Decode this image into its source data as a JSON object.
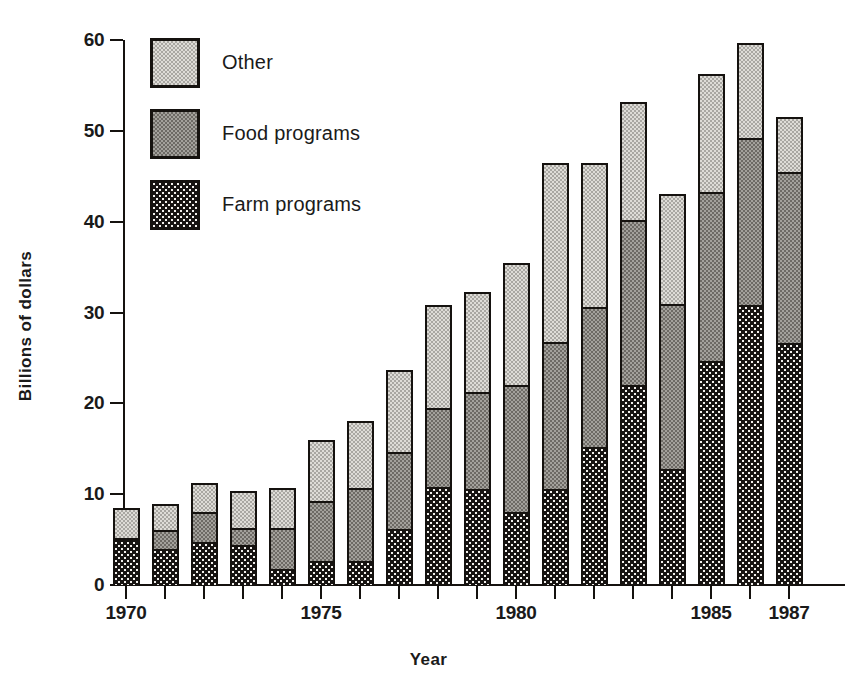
{
  "chart_data": {
    "type": "bar",
    "subtype": "stacked",
    "title": "",
    "xlabel": "Year",
    "ylabel": "Billions of dollars",
    "categories": [
      "1970",
      "1971",
      "1972",
      "1973",
      "1974",
      "1975",
      "1976",
      "1977",
      "1978",
      "1979",
      "1980",
      "1981",
      "1982",
      "1983",
      "1984",
      "1985",
      "1986",
      "1987"
    ],
    "visible_tick_labels": [
      "1970",
      "1975",
      "1980",
      "1985",
      "1987"
    ],
    "ylim": [
      0,
      60
    ],
    "yticks": [
      0,
      10,
      20,
      30,
      40,
      50,
      60
    ],
    "ytick_labels": [
      "0",
      "10",
      "20",
      "30",
      "40",
      "50",
      "60"
    ],
    "grid": false,
    "legend_position": "upper-left-inside",
    "series": [
      {
        "name": "Farm programs",
        "color": "#171412",
        "texture": "dark-dotted",
        "values": [
          5.0,
          4.0,
          4.7,
          4.4,
          1.8,
          2.6,
          2.6,
          6.2,
          10.8,
          10.6,
          8.0,
          10.6,
          15.2,
          22.0,
          12.8,
          24.7,
          30.8,
          26.6
        ]
      },
      {
        "name": "Food programs",
        "color": "#a3a19c",
        "texture": "mid-checker",
        "values": [
          0.2,
          2.1,
          3.3,
          1.9,
          4.5,
          6.6,
          8.1,
          8.4,
          8.7,
          10.7,
          14.0,
          16.1,
          15.4,
          18.2,
          18.1,
          18.6,
          18.4,
          18.9
        ]
      },
      {
        "name": "Other",
        "color": "#dedcd7",
        "texture": "light-checker",
        "values": [
          3.3,
          2.8,
          3.2,
          4.0,
          4.4,
          6.8,
          7.4,
          9.1,
          11.3,
          11.0,
          13.4,
          19.8,
          15.9,
          13.0,
          12.1,
          13.0,
          10.5,
          6.0
        ]
      }
    ],
    "totals": [
      8.5,
      8.9,
      11.2,
      10.3,
      10.7,
      16.0,
      18.1,
      23.7,
      30.8,
      32.3,
      35.4,
      46.5,
      46.5,
      53.2,
      43.0,
      56.3,
      59.7,
      51.5
    ]
  },
  "legend": {
    "items": [
      {
        "label": "Other",
        "series": "Other"
      },
      {
        "label": "Food programs",
        "series": "Food programs"
      },
      {
        "label": "Farm programs",
        "series": "Farm programs"
      }
    ]
  }
}
